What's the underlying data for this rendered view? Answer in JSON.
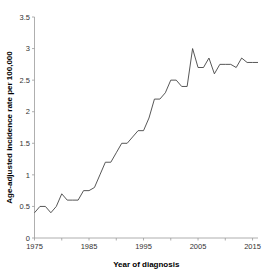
{
  "chart_data": {
    "type": "line",
    "title": "",
    "xlabel": "Year of diagnosis",
    "ylabel": "Age-adjusted incidence rate per 100,000",
    "xlim": [
      1975,
      2016
    ],
    "ylim": [
      0,
      3.5
    ],
    "xticks": [
      1975,
      1985,
      1995,
      2005,
      2015
    ],
    "xtick_labels": [
      "1975",
      "1985",
      "1995",
      "2005",
      "2015"
    ],
    "yticks": [
      0,
      0.5,
      1,
      1.5,
      2,
      2.5,
      3,
      3.5
    ],
    "ytick_labels": [
      "0",
      "0.5",
      "1",
      "1.5",
      "2",
      "2.5",
      "3",
      "3.5"
    ],
    "grid": false,
    "legend": false,
    "line_color": "#444444",
    "series": [
      {
        "name": "Age-adjusted incidence rate",
        "x": [
          1975,
          1976,
          1977,
          1978,
          1979,
          1980,
          1981,
          1982,
          1983,
          1984,
          1985,
          1986,
          1987,
          1988,
          1989,
          1990,
          1991,
          1992,
          1993,
          1994,
          1995,
          1996,
          1997,
          1998,
          1999,
          2000,
          2001,
          2002,
          2003,
          2004,
          2005,
          2006,
          2007,
          2008,
          2009,
          2010,
          2011,
          2012,
          2013,
          2014,
          2015,
          2016
        ],
        "values": [
          0.4,
          0.5,
          0.5,
          0.4,
          0.5,
          0.7,
          0.6,
          0.6,
          0.6,
          0.75,
          0.75,
          0.8,
          1.0,
          1.2,
          1.2,
          1.35,
          1.5,
          1.5,
          1.6,
          1.7,
          1.7,
          1.9,
          2.2,
          2.2,
          2.3,
          2.5,
          2.5,
          2.4,
          2.4,
          3.0,
          2.7,
          2.7,
          2.85,
          2.6,
          2.75,
          2.75,
          2.75,
          2.7,
          2.85,
          2.78,
          2.78,
          2.78
        ]
      }
    ]
  },
  "axes": {
    "x_axis_title": "Year of diagnosis",
    "y_axis_title": "Age-adjusted incidence rate per 100,000"
  }
}
